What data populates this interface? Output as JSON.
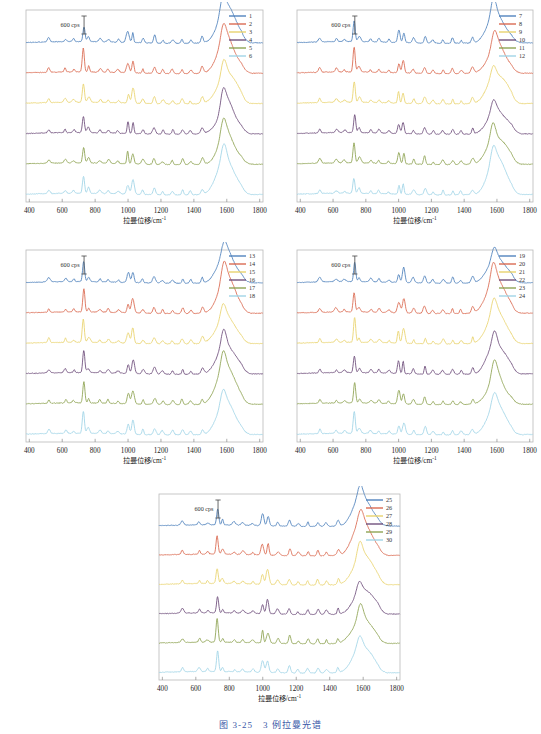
{
  "figure": {
    "caption": "图 3-25　3 例拉曼光谱",
    "axis_x_label_main": "拉曼位移/cm",
    "axis_x_label_sup": "-1",
    "scale_annotation": "600 cps",
    "x_ticks": [
      400,
      600,
      800,
      1000,
      1200,
      1400,
      1600,
      1800
    ],
    "xlim": [
      380,
      1820
    ]
  },
  "colors": {
    "s1": "#4a7ebb",
    "s2": "#d9654c",
    "s3": "#e8d26a",
    "s4": "#6b4a78",
    "s5": "#8ba14e",
    "s6": "#9ed3e6",
    "frame": "#b9b9b9",
    "caption": "#3a59a8"
  },
  "chart_data": {
    "type": "line",
    "title": "图 3-25　3 例拉曼光谱",
    "xlabel": "拉曼位移/cm-1",
    "ylabel": "",
    "xlim": [
      380,
      1820
    ],
    "grid": false,
    "legend_position": "top-right",
    "scale_bar": {
      "label": "600 cps",
      "value": 600,
      "units": "cps"
    },
    "panels": [
      {
        "index": 1,
        "legend": [
          "1",
          "2",
          "3",
          "4",
          "5",
          "6"
        ]
      },
      {
        "index": 2,
        "legend": [
          "7",
          "8",
          "9",
          "10",
          "11",
          "12"
        ]
      },
      {
        "index": 3,
        "legend": [
          "13",
          "14",
          "15",
          "16",
          "17",
          "18"
        ]
      },
      {
        "index": 4,
        "legend": [
          "19",
          "20",
          "21",
          "22",
          "23",
          "24"
        ]
      },
      {
        "index": 5,
        "legend": [
          "25",
          "26",
          "27",
          "28",
          "29",
          "30"
        ]
      }
    ],
    "peaks_cm1": [
      520,
      620,
      670,
      730,
      760,
      830,
      880,
      940,
      1000,
      1030,
      1090,
      1160,
      1210,
      1270,
      1330,
      1380,
      1450,
      1550,
      1600,
      1660
    ],
    "peak_intensities": [
      0.16,
      0.14,
      0.1,
      0.82,
      0.2,
      0.12,
      0.13,
      0.11,
      0.44,
      0.52,
      0.18,
      0.3,
      0.14,
      0.17,
      0.2,
      0.15,
      0.22,
      0.42,
      1.0,
      0.38
    ],
    "series_count": 30,
    "series_per_panel": 6
  }
}
